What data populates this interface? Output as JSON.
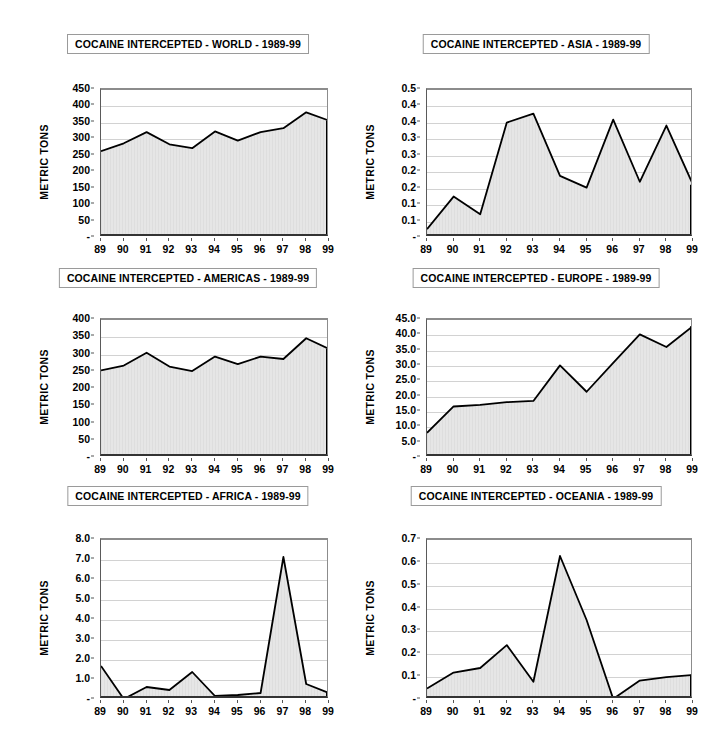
{
  "page": {
    "background": "#ffffff",
    "axis_label": "METRIC TONS",
    "width": 712,
    "height": 752
  },
  "charts": [
    {
      "key": "world",
      "title": "COCAINE INTERCEPTED - WORLD - 1989-99",
      "ylabel": "METRIC TONS",
      "zero_label": "-",
      "yticks": [
        "450",
        "400",
        "350",
        "300",
        "250",
        "200",
        "150",
        "100",
        "50",
        "-"
      ],
      "chart_data": {
        "type": "area",
        "title": "COCAINE INTERCEPTED - WORLD - 1989-99",
        "xlabel": "",
        "ylabel": "METRIC TONS",
        "categories": [
          "89",
          "90",
          "91",
          "92",
          "93",
          "94",
          "95",
          "96",
          "97",
          "98",
          "99"
        ],
        "values": [
          264,
          288,
          322,
          285,
          273,
          324,
          296,
          322,
          334,
          382,
          357
        ],
        "ylim": [
          0,
          450
        ],
        "ytick_values": [
          0,
          50,
          100,
          150,
          200,
          250,
          300,
          350,
          400,
          450
        ],
        "grid": true,
        "legend": "none"
      }
    },
    {
      "key": "asia",
      "title": "COCAINE INTERCEPTED - ASIA - 1989-99",
      "ylabel": "METRIC TONS",
      "zero_label": "-",
      "yticks": [
        "0.5",
        "0.4",
        "0.4",
        "0.3",
        "0.3",
        "0.2",
        "0.2",
        "0.1",
        "0.1",
        "-"
      ],
      "chart_data": {
        "type": "area",
        "title": "COCAINE INTERCEPTED - ASIA - 1989-99",
        "xlabel": "",
        "ylabel": "METRIC TONS",
        "categories": [
          "89",
          "90",
          "91",
          "92",
          "93",
          "94",
          "95",
          "96",
          "97",
          "98",
          "99"
        ],
        "values": [
          0.03,
          0.14,
          0.08,
          0.39,
          0.42,
          0.21,
          0.17,
          0.4,
          0.19,
          0.38,
          0.18
        ],
        "ylim": [
          0,
          0.5
        ],
        "ytick_values": [
          0,
          0.05,
          0.1,
          0.15,
          0.2,
          0.25,
          0.3,
          0.35,
          0.4,
          0.45,
          0.5
        ],
        "grid": true,
        "legend": "none"
      }
    },
    {
      "key": "americas",
      "title": "COCAINE INTERCEPTED - AMERICAS - 1989-99",
      "ylabel": "METRIC TONS",
      "zero_label": "-",
      "yticks": [
        "400",
        "350",
        "300",
        "250",
        "200",
        "150",
        "100",
        "50",
        "-"
      ],
      "chart_data": {
        "type": "area",
        "title": "COCAINE INTERCEPTED - AMERICAS - 1989-99",
        "xlabel": "",
        "ylabel": "METRIC TONS",
        "categories": [
          "89",
          "90",
          "91",
          "92",
          "93",
          "94",
          "95",
          "96",
          "97",
          "98",
          "99"
        ],
        "values": [
          254,
          268,
          305,
          265,
          252,
          294,
          272,
          294,
          287,
          347,
          316
        ],
        "ylim": [
          0,
          400
        ],
        "ytick_values": [
          0,
          50,
          100,
          150,
          200,
          250,
          300,
          350,
          400
        ],
        "grid": true,
        "legend": "none"
      }
    },
    {
      "key": "europe",
      "title": "COCAINE INTERCEPTED - EUROPE - 1989-99",
      "ylabel": "METRIC TONS",
      "zero_label": "-",
      "yticks": [
        "45.0",
        "40.0",
        "35.0",
        "30.0",
        "25.0",
        "20.0",
        "15.0",
        "10.0",
        "5.0",
        "-"
      ],
      "chart_data": {
        "type": "area",
        "title": "COCAINE INTERCEPTED - EUROPE - 1989-99",
        "xlabel": "",
        "ylabel": "METRIC TONS",
        "categories": [
          "89",
          "90",
          "91",
          "92",
          "93",
          "94",
          "95",
          "96",
          "97",
          "98",
          "99"
        ],
        "values": [
          8.2,
          16.8,
          17.3,
          18.2,
          18.6,
          30.2,
          21.6,
          31.0,
          40.3,
          36.2,
          43.0
        ],
        "ylim": [
          0,
          45
        ],
        "ytick_values": [
          0,
          5,
          10,
          15,
          20,
          25,
          30,
          35,
          40,
          45
        ],
        "grid": true,
        "legend": "none"
      }
    },
    {
      "key": "africa",
      "title": "COCAINE INTERCEPTED - AFRICA - 1989-99",
      "ylabel": "METRIC TONS",
      "zero_label": "-",
      "yticks": [
        "8.0",
        "7.0",
        "6.0",
        "5.0",
        "4.0",
        "3.0",
        "2.0",
        "1.0",
        "-"
      ],
      "chart_data": {
        "type": "area",
        "title": "COCAINE INTERCEPTED - AFRICA - 1989-99",
        "xlabel": "",
        "ylabel": "METRIC TONS",
        "categories": [
          "89",
          "90",
          "91",
          "92",
          "93",
          "94",
          "95",
          "96",
          "97",
          "98",
          "99"
        ],
        "values": [
          1.7,
          0.05,
          0.65,
          0.5,
          1.4,
          0.2,
          0.25,
          0.35,
          7.15,
          0.8,
          0.35
        ],
        "ylim": [
          0,
          8
        ],
        "ytick_values": [
          0,
          1,
          2,
          3,
          4,
          5,
          6,
          7,
          8
        ],
        "grid": true,
        "legend": "none"
      }
    },
    {
      "key": "oceania",
      "title": "COCAINE INTERCEPTED - OCEANIA - 1989-99",
      "ylabel": "METRIC TONS",
      "zero_label": "-",
      "yticks": [
        "0.7",
        "0.6",
        "0.5",
        "0.4",
        "0.3",
        "0.2",
        "0.1",
        "-"
      ],
      "chart_data": {
        "type": "area",
        "title": "COCAINE INTERCEPTED - OCEANIA - 1989-99",
        "xlabel": "",
        "ylabel": "METRIC TONS",
        "categories": [
          "89",
          "90",
          "91",
          "92",
          "93",
          "94",
          "95",
          "96",
          "97",
          "98",
          "99"
        ],
        "values": [
          0.05,
          0.12,
          0.14,
          0.24,
          0.08,
          0.63,
          0.35,
          0.005,
          0.085,
          0.1,
          0.11
        ],
        "ylim": [
          0,
          0.7
        ],
        "ytick_values": [
          0,
          0.1,
          0.2,
          0.3,
          0.4,
          0.5,
          0.6,
          0.7
        ],
        "grid": true,
        "legend": "none"
      }
    }
  ],
  "style": {
    "area_fill": "#e6e6e6",
    "line_color": "#000000",
    "grid_color": "#d2d2d2",
    "axis_color": "#8c8c8c",
    "text_color": "#000000"
  }
}
